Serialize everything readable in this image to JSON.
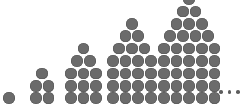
{
  "figure": {
    "caption": "",
    "background_color": "#ffffff",
    "dot_color": "#6b6b6b",
    "dot_stroke_color": "#555555",
    "ellipsis_color": "#5e5e5e",
    "ellipsis_label": "...",
    "ellipsis_dot_count": 3,
    "alt_text": "Five growing arrangements of gray dots forming house shapes, containing 1, 5, 12, 22 and 35 dots, followed by an ellipsis."
  },
  "chart_data": {
    "type": "scatter",
    "subtitle": "",
    "xlabel": "",
    "ylabel": "",
    "grid": false,
    "legend": "none",
    "categories": [
      "1",
      "2",
      "3",
      "4",
      "5"
    ],
    "values": [
      1,
      5,
      12,
      22,
      35
    ],
    "series": [
      {
        "name": "Dots per figure",
        "values": [
          1,
          5,
          12,
          22,
          35
        ]
      }
    ],
    "annotations": [
      "..."
    ],
    "groups": [
      {
        "index": 1,
        "total_dots": 1,
        "rows": [
          1
        ],
        "row_count": 1,
        "base_width": 1,
        "triangle_rows": [
          1
        ],
        "body_rows": []
      },
      {
        "index": 2,
        "total_dots": 5,
        "rows": [
          1,
          2,
          2
        ],
        "row_count": 3,
        "base_width": 2,
        "triangle_rows": [
          1,
          2
        ],
        "body_rows": [
          2
        ]
      },
      {
        "index": 3,
        "total_dots": 12,
        "rows": [
          1,
          2,
          3,
          3,
          3
        ],
        "row_count": 5,
        "base_width": 3,
        "triangle_rows": [
          1,
          2,
          3
        ],
        "body_rows": [
          3,
          3
        ]
      },
      {
        "index": 4,
        "total_dots": 22,
        "rows": [
          1,
          2,
          3,
          4,
          4,
          4,
          4
        ],
        "row_count": 7,
        "base_width": 4,
        "triangle_rows": [
          1,
          2,
          3,
          4
        ],
        "body_rows": [
          4,
          4,
          4
        ]
      },
      {
        "index": 5,
        "total_dots": 35,
        "rows": [
          1,
          2,
          3,
          4,
          5,
          5,
          5,
          5,
          5
        ],
        "row_count": 9,
        "base_width": 5,
        "triangle_rows": [
          1,
          2,
          3,
          4,
          5
        ],
        "body_rows": [
          5,
          5,
          5,
          5
        ]
      }
    ]
  },
  "layout": {
    "canvas_width": 245,
    "canvas_height": 110,
    "dot_diameter": 11.6,
    "dot_gap_x": 1.1,
    "dot_gap_y": 0.8,
    "baseline_y": 104,
    "group_left_positions": [
      3,
      30,
      65,
      107,
      158
    ],
    "ellipsis_left": 219,
    "ellipsis_bottom": 94
  }
}
